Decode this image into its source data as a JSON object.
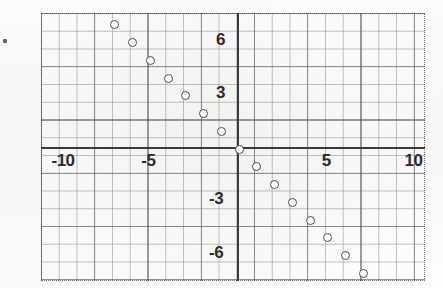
{
  "figure": {
    "kind": "graph-paper-scatter-plot",
    "background_color": "#fdfdfc",
    "ink_color": "#3a3a3a",
    "grid_color": "#505050"
  },
  "axis_labels": {
    "x_neg_10": "-10",
    "x_neg_5": "-5",
    "x_pos_5": "5",
    "x_pos_10": "10",
    "y_pos_6": "6",
    "y_pos_3": "3",
    "y_neg_3": "-3",
    "y_neg_6": "-6"
  },
  "chart_data": {
    "type": "scatter",
    "title": "",
    "xlabel": "",
    "ylabel": "",
    "xlim": [
      -11.2,
      10.5
    ],
    "ylim": [
      -7.6,
      7.6
    ],
    "xticks": [
      -10,
      -5,
      5,
      10
    ],
    "yticks": [
      6,
      3,
      -3,
      -6
    ],
    "grid": true,
    "grid_minor_step": 1,
    "grid_major_step": 3,
    "legend": "none",
    "marker": "open-circle",
    "series": [
      {
        "name": "points",
        "x": [
          -7,
          -6,
          -5,
          -4,
          -3,
          -2,
          -1,
          0,
          1,
          2,
          3,
          4,
          5,
          6,
          7
        ],
        "y": [
          7,
          6,
          5,
          4,
          3,
          2,
          1,
          0,
          -1,
          -2,
          -3,
          -4,
          -5,
          -6,
          -7
        ]
      }
    ]
  }
}
